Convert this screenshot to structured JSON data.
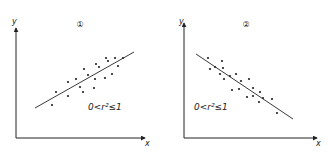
{
  "chart_data": [
    {
      "type": "scatter",
      "title": "①",
      "xlabel": "x",
      "ylabel": "y",
      "annotation": "0<r²≤1",
      "trend": "positive",
      "regression_line": {
        "x1": 35,
        "y1": 108,
        "x2": 134,
        "y2": 52
      },
      "axes": {
        "origin": [
          16,
          138
        ],
        "y_top": 28,
        "x_right": 145
      },
      "points": [
        [
          52,
          105
        ],
        [
          56,
          92
        ],
        [
          68,
          96
        ],
        [
          68,
          82
        ],
        [
          76,
          79
        ],
        [
          80,
          87
        ],
        [
          83,
          92
        ],
        [
          84,
          69
        ],
        [
          88,
          75
        ],
        [
          94,
          88
        ],
        [
          95,
          79
        ],
        [
          96,
          64
        ],
        [
          99,
          67
        ],
        [
          105,
          78
        ],
        [
          106,
          58
        ],
        [
          108,
          61
        ],
        [
          112,
          74
        ],
        [
          115,
          58
        ],
        [
          118,
          66
        ],
        [
          123,
          58
        ]
      ],
      "labels_pos": {
        "title": [
          80,
          27
        ],
        "annotation": [
          88,
          110
        ],
        "ylabel": [
          12,
          24
        ],
        "xlabel": [
          145,
          146
        ]
      }
    },
    {
      "type": "scatter",
      "title": "②",
      "xlabel": "x",
      "ylabel": "y",
      "annotation": "0<r²≤1",
      "trend": "negative",
      "regression_line": {
        "x1": 196,
        "y1": 54,
        "x2": 293,
        "y2": 119
      },
      "axes": {
        "origin": [
          184,
          138
        ],
        "y_top": 23,
        "x_right": 317
      },
      "points": [
        [
          208,
          58
        ],
        [
          210,
          69
        ],
        [
          222,
          61
        ],
        [
          215,
          67
        ],
        [
          223,
          68
        ],
        [
          220,
          74
        ],
        [
          224,
          79
        ],
        [
          230,
          76
        ],
        [
          236,
          74
        ],
        [
          241,
          81
        ],
        [
          249,
          79
        ],
        [
          232,
          90
        ],
        [
          239,
          89
        ],
        [
          253,
          88
        ],
        [
          247,
          97
        ],
        [
          253,
          96
        ],
        [
          260,
          92
        ],
        [
          263,
          98
        ],
        [
          259,
          102
        ],
        [
          272,
          99
        ],
        [
          277,
          113
        ]
      ],
      "labels_pos": {
        "title": [
          246,
          27
        ],
        "annotation": [
          194,
          110
        ],
        "ylabel": [
          179,
          24
        ],
        "xlabel": [
          316,
          146
        ]
      }
    }
  ],
  "colors": {
    "ink": "#222222",
    "background": "#ffffff"
  }
}
